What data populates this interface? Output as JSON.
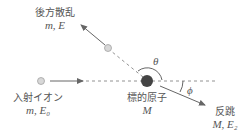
{
  "diagram": {
    "title": "",
    "colors": {
      "line": "#666666",
      "target": "#444444",
      "ion": "#d8d8d8",
      "ion_stroke": "#999999"
    },
    "incident": {
      "label": "入射イオン",
      "params": "m, E₀"
    },
    "target": {
      "label": "標的原子",
      "params": "M"
    },
    "backscatter": {
      "label": "後方散乱",
      "params": "m, E"
    },
    "recoil": {
      "label": "反跳",
      "params": "M, E₂"
    },
    "angles": {
      "theta": "θ",
      "phi": "ϕ"
    }
  }
}
